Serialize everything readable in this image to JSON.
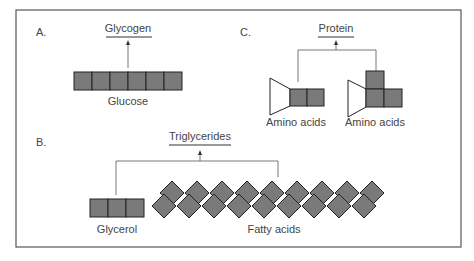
{
  "panels": {
    "A": {
      "letter": "A.",
      "product": "Glycogen",
      "monomer": "Glucose",
      "units": 6
    },
    "B": {
      "letter": "B.",
      "product": "Triglycerides",
      "components": [
        {
          "label": "Glycerol",
          "units": 3
        },
        {
          "label": "Fatty acids",
          "top_row": 9,
          "bottom_row": 9
        }
      ]
    },
    "C": {
      "letter": "C.",
      "product": "Protein",
      "components": [
        {
          "label": "Amino acids",
          "shape": "linear"
        },
        {
          "label": "Amino acids",
          "shape": "branched"
        }
      ]
    }
  },
  "colors": {
    "unit_fill": "#7a7a7a",
    "unit_stroke": "#222222",
    "line": "#555555",
    "border": "#555555",
    "text": "#444444"
  }
}
